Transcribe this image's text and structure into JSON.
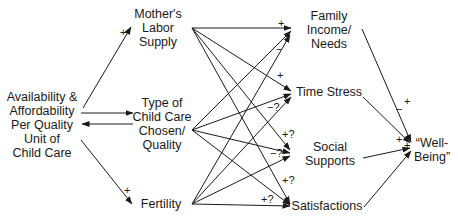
{
  "nodes": {
    "availability": {
      "lines": [
        "Availability &",
        "Affordability",
        "Per Quality",
        "Unit of",
        "Child Care"
      ]
    },
    "labor": {
      "lines": [
        "Mother's",
        "Labor",
        "Supply"
      ]
    },
    "childcare_type": {
      "lines": [
        "Type of",
        "Child Care",
        "Chosen/",
        "Quality"
      ]
    },
    "fertility": {
      "lines": [
        "Fertility"
      ]
    },
    "income": {
      "lines": [
        "Family",
        "Income/",
        "Needs"
      ]
    },
    "time_stress": {
      "lines": [
        "Time Stress"
      ]
    },
    "social": {
      "lines": [
        "Social",
        "Supports"
      ]
    },
    "satisfactions": {
      "lines": [
        "Satisfactions"
      ]
    },
    "wellbeing": {
      "lines": [
        "“Well-",
        "Being”"
      ]
    }
  },
  "edge_labels": {
    "avail_to_labor": "+",
    "avail_to_fertility": "+",
    "labor_to_income": "+",
    "childcare_to_income": "−",
    "labor_to_timestress": "+",
    "childcare_to_timestress": "−?",
    "fertility_to_social": "+?",
    "childcare_to_social": "−?",
    "labor_to_satisfactions": "+?",
    "fertility_to_satisfactions": "+?",
    "income_to_wellbeing": "+",
    "timestress_to_wellbeing": "−",
    "social_to_wellbeing": "+",
    "satisfactions_to_wellbeing": "+"
  },
  "colors": {
    "line": "#1a1a1a",
    "background": "#ffffff"
  }
}
